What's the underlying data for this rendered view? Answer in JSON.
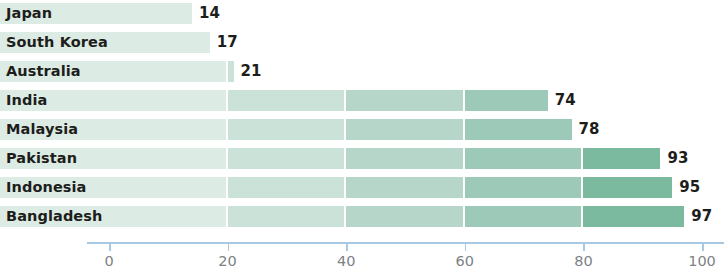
{
  "chart_data": {
    "type": "bar",
    "orientation": "horizontal",
    "title": "",
    "subtitle": "",
    "xlabel": "",
    "ylabel": "",
    "categories": [
      "Japan",
      "South Korea",
      "Australia",
      "India",
      "Malaysia",
      "Pakistan",
      "Indonesia",
      "Bangladesh"
    ],
    "values": [
      14,
      17,
      21,
      74,
      78,
      93,
      95,
      97
    ],
    "value_labels": [
      "14",
      "17",
      "21",
      "74",
      "78",
      "93",
      "95",
      "97"
    ],
    "xlim": [
      0,
      100
    ],
    "xticks": [
      0,
      20,
      40,
      60,
      80,
      100
    ],
    "xtick_labels": [
      "0",
      "20",
      "40",
      "60",
      "80",
      "100"
    ],
    "grid": false,
    "legend": "none",
    "series": [
      {
        "name": "",
        "values": [
          14,
          17,
          21,
          74,
          78,
          93,
          95,
          97
        ]
      }
    ],
    "bar_segment_breaks": [
      20,
      40,
      60,
      80
    ],
    "colors": {
      "segment_1": "#dcebe3",
      "segment_2": "#cbe2d8",
      "segment_3": "#b5d6c8",
      "segment_4": "#9dcab8",
      "segment_5": "#7cba9f",
      "axis_line": "#a9c9e3",
      "tick_label": "#7d8285",
      "category_label": "#1d1d1b",
      "value_label": "#1d1d1b",
      "background": "#ffffff"
    }
  },
  "rows": [
    {
      "label": "Japan",
      "value": 14,
      "value_text": "14"
    },
    {
      "label": "South Korea",
      "value": 17,
      "value_text": "17"
    },
    {
      "label": "Australia",
      "value": 21,
      "value_text": "21"
    },
    {
      "label": "India",
      "value": 74,
      "value_text": "74"
    },
    {
      "label": "Malaysia",
      "value": 78,
      "value_text": "78"
    },
    {
      "label": "Pakistan",
      "value": 93,
      "value_text": "93"
    },
    {
      "label": "Indonesia",
      "value": 95,
      "value_text": "95"
    },
    {
      "label": "Bangladesh",
      "value": 97,
      "value_text": "97"
    }
  ],
  "axis": {
    "ticks": [
      {
        "value": 0,
        "label": "0"
      },
      {
        "value": 20,
        "label": "20"
      },
      {
        "value": 40,
        "label": "40"
      },
      {
        "value": 60,
        "label": "60"
      },
      {
        "value": 80,
        "label": "80"
      },
      {
        "value": 100,
        "label": "100"
      }
    ]
  }
}
